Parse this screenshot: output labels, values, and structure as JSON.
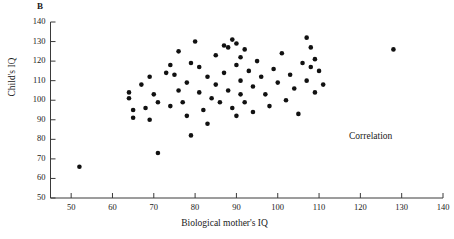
{
  "panel": {
    "letter": "B"
  },
  "annotation": {
    "text": "Correlation"
  },
  "chart_data": {
    "type": "scatter",
    "title": "",
    "panel_label": "B",
    "xlabel": "Biological mother's IQ",
    "ylabel": "Child's IQ",
    "xlim": [
      45,
      140
    ],
    "ylim": [
      50,
      140
    ],
    "xticks": [
      50,
      60,
      70,
      80,
      90,
      100,
      110,
      120,
      130,
      140
    ],
    "yticks": [
      50,
      60,
      70,
      80,
      90,
      100,
      110,
      120,
      130,
      140
    ],
    "grid": false,
    "legend": null,
    "annotations": [
      {
        "text": "Correlation",
        "x": 114,
        "y": 88
      }
    ],
    "marker": {
      "shape": "circle",
      "color": "#111111",
      "size": 3.4
    },
    "points": [
      [
        52,
        66
      ],
      [
        64,
        104
      ],
      [
        64,
        101
      ],
      [
        65,
        95
      ],
      [
        65,
        91
      ],
      [
        67,
        108
      ],
      [
        68,
        96
      ],
      [
        69,
        112
      ],
      [
        69,
        90
      ],
      [
        70,
        103
      ],
      [
        71,
        73
      ],
      [
        71,
        99
      ],
      [
        73,
        114
      ],
      [
        74,
        118
      ],
      [
        74,
        97
      ],
      [
        75,
        113
      ],
      [
        76,
        125
      ],
      [
        76,
        105
      ],
      [
        77,
        99
      ],
      [
        78,
        109
      ],
      [
        78,
        92
      ],
      [
        79,
        119
      ],
      [
        79,
        82
      ],
      [
        80,
        130
      ],
      [
        81,
        117
      ],
      [
        81,
        104
      ],
      [
        82,
        95
      ],
      [
        83,
        112
      ],
      [
        83,
        88
      ],
      [
        84,
        101
      ],
      [
        85,
        123
      ],
      [
        85,
        108
      ],
      [
        86,
        99
      ],
      [
        87,
        128
      ],
      [
        87,
        114
      ],
      [
        88,
        127
      ],
      [
        88,
        105
      ],
      [
        89,
        131
      ],
      [
        89,
        96
      ],
      [
        90,
        129
      ],
      [
        90,
        118
      ],
      [
        90,
        92
      ],
      [
        91,
        122
      ],
      [
        91,
        110
      ],
      [
        91,
        103
      ],
      [
        92,
        126
      ],
      [
        92,
        99
      ],
      [
        93,
        115
      ],
      [
        94,
        107
      ],
      [
        94,
        94
      ],
      [
        95,
        120
      ],
      [
        96,
        112
      ],
      [
        97,
        103
      ],
      [
        98,
        97
      ],
      [
        99,
        116
      ],
      [
        100,
        109
      ],
      [
        101,
        124
      ],
      [
        102,
        100
      ],
      [
        103,
        113
      ],
      [
        104,
        106
      ],
      [
        105,
        93
      ],
      [
        106,
        119
      ],
      [
        107,
        132
      ],
      [
        107,
        110
      ],
      [
        108,
        127
      ],
      [
        108,
        117
      ],
      [
        109,
        121
      ],
      [
        109,
        104
      ],
      [
        110,
        115
      ],
      [
        111,
        108
      ],
      [
        128,
        126
      ]
    ]
  }
}
